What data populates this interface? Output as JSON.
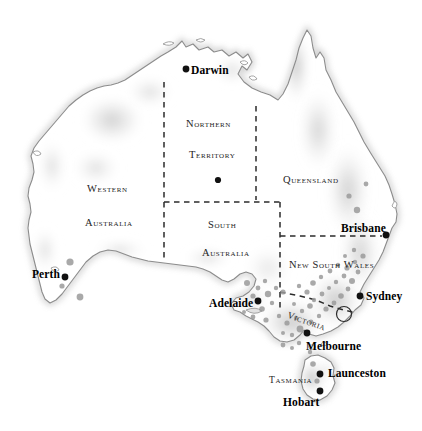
{
  "map": {
    "title": "Australia",
    "background_color": "#ffffff",
    "coast_color": "#8c8c8c",
    "relief_color": "#b5b5b5",
    "border_color": "#2b2b2b",
    "city_dot_color": "#111111",
    "site_dot_color": "#9a9a9a",
    "width": 422,
    "height": 431
  },
  "states": [
    {
      "name": "state-northern-territory",
      "line1": "Northern",
      "line2": "Territory",
      "x": 186,
      "y": 119,
      "x2": 189,
      "y2": 150
    },
    {
      "name": "state-western-australia",
      "line1": "Western",
      "line2": "Australia",
      "x": 87,
      "y": 184,
      "x2": 85,
      "y2": 218
    },
    {
      "name": "state-south-australia",
      "line1": "South",
      "line2": "Australia",
      "x": 208,
      "y": 220,
      "x2": 202,
      "y2": 248
    },
    {
      "name": "state-queensland",
      "line1": "Queensland",
      "x": 283,
      "y": 175
    },
    {
      "name": "state-new-south-wales",
      "line1": "New South Wales",
      "x": 289,
      "y": 260
    },
    {
      "name": "state-victoria",
      "line1": "Victoria",
      "x": 289,
      "y": 311
    },
    {
      "name": "state-tasmania",
      "line1": "Tasmania",
      "x": 269,
      "y": 376
    }
  ],
  "cities": [
    {
      "name": "city-darwin",
      "label": "Darwin",
      "label_x": 191,
      "label_y": 65,
      "dot_x": 186,
      "dot_y": 69,
      "side": "right"
    },
    {
      "name": "city-perth",
      "label": "Perth",
      "label_x": 32,
      "label_y": 269,
      "dot_x": 65,
      "dot_y": 277,
      "side": "left"
    },
    {
      "name": "city-adelaide",
      "label": "Adelaide",
      "label_x": 209,
      "label_y": 298,
      "dot_x": 258,
      "dot_y": 301,
      "side": "left"
    },
    {
      "name": "city-brisbane",
      "label": "Brisbane",
      "label_x": 341,
      "label_y": 223,
      "dot_x": 386,
      "dot_y": 235,
      "side": "left"
    },
    {
      "name": "city-sydney",
      "label": "Sydney",
      "label_x": 366,
      "label_y": 291,
      "dot_x": 360,
      "dot_y": 296,
      "side": "right"
    },
    {
      "name": "city-melbourne",
      "label": "Melbourne",
      "label_x": 306,
      "label_y": 341,
      "dot_x": 307,
      "dot_y": 333,
      "side": "above"
    },
    {
      "name": "city-launceston",
      "label": "Launceston",
      "label_x": 328,
      "label_y": 368,
      "dot_x": 320,
      "dot_y": 374,
      "side": "right"
    },
    {
      "name": "city-hobart",
      "label": "Hobart",
      "label_x": 283,
      "label_y": 397,
      "dot_x": 320,
      "dot_y": 391,
      "side": "left"
    }
  ],
  "unlabeled_capital_dot": {
    "name": "dot-alice-springs",
    "x": 218,
    "y": 180,
    "r": 3.1
  },
  "act_circle": {
    "name": "act-boundary-circle",
    "cx": 344,
    "cy": 314,
    "r": 7.5
  },
  "site_dots": [
    {
      "x": 70,
      "y": 262,
      "r": 3.6
    },
    {
      "x": 62,
      "y": 286,
      "r": 2.6
    },
    {
      "x": 80,
      "y": 297,
      "r": 3.4
    },
    {
      "x": 247,
      "y": 283,
      "r": 3.0
    },
    {
      "x": 258,
      "y": 288,
      "r": 2.4
    },
    {
      "x": 265,
      "y": 281,
      "r": 2.2
    },
    {
      "x": 253,
      "y": 296,
      "r": 2.6
    },
    {
      "x": 268,
      "y": 294,
      "r": 3.2
    },
    {
      "x": 276,
      "y": 288,
      "r": 2.2
    },
    {
      "x": 283,
      "y": 292,
      "r": 2.6
    },
    {
      "x": 272,
      "y": 303,
      "r": 2.2
    },
    {
      "x": 262,
      "y": 309,
      "r": 2.8
    },
    {
      "x": 253,
      "y": 317,
      "r": 2.4
    },
    {
      "x": 244,
      "y": 312,
      "r": 2.0
    },
    {
      "x": 266,
      "y": 320,
      "r": 2.6
    },
    {
      "x": 279,
      "y": 316,
      "r": 2.2
    },
    {
      "x": 287,
      "y": 323,
      "r": 2.6
    },
    {
      "x": 296,
      "y": 318,
      "r": 2.2
    },
    {
      "x": 300,
      "y": 329,
      "r": 3.4
    },
    {
      "x": 292,
      "y": 335,
      "r": 2.2
    },
    {
      "x": 283,
      "y": 333,
      "r": 2.0
    },
    {
      "x": 311,
      "y": 322,
      "r": 2.4
    },
    {
      "x": 319,
      "y": 316,
      "r": 2.2
    },
    {
      "x": 326,
      "y": 309,
      "r": 2.6
    },
    {
      "x": 334,
      "y": 303,
      "r": 2.4
    },
    {
      "x": 341,
      "y": 296,
      "r": 2.8
    },
    {
      "x": 348,
      "y": 289,
      "r": 2.4
    },
    {
      "x": 352,
      "y": 281,
      "r": 3.0
    },
    {
      "x": 344,
      "y": 276,
      "r": 2.4
    },
    {
      "x": 336,
      "y": 282,
      "r": 2.2
    },
    {
      "x": 329,
      "y": 288,
      "r": 2.0
    },
    {
      "x": 322,
      "y": 294,
      "r": 2.4
    },
    {
      "x": 314,
      "y": 300,
      "r": 2.2
    },
    {
      "x": 307,
      "y": 292,
      "r": 2.6
    },
    {
      "x": 299,
      "y": 286,
      "r": 2.2
    },
    {
      "x": 313,
      "y": 283,
      "r": 2.8
    },
    {
      "x": 321,
      "y": 277,
      "r": 2.2
    },
    {
      "x": 330,
      "y": 271,
      "r": 2.4
    },
    {
      "x": 338,
      "y": 265,
      "r": 2.2
    },
    {
      "x": 347,
      "y": 268,
      "r": 2.6
    },
    {
      "x": 355,
      "y": 262,
      "r": 2.2
    },
    {
      "x": 358,
      "y": 272,
      "r": 2.4
    },
    {
      "x": 363,
      "y": 256,
      "r": 2.6
    },
    {
      "x": 354,
      "y": 250,
      "r": 2.2
    },
    {
      "x": 345,
      "y": 256,
      "r": 2.0
    },
    {
      "x": 310,
      "y": 306,
      "r": 2.8
    },
    {
      "x": 302,
      "y": 311,
      "r": 2.2
    },
    {
      "x": 294,
      "y": 304,
      "r": 2.0
    },
    {
      "x": 357,
      "y": 210,
      "r": 3.2
    },
    {
      "x": 349,
      "y": 196,
      "r": 2.6
    },
    {
      "x": 366,
      "y": 184,
      "r": 2.4
    },
    {
      "x": 313,
      "y": 364,
      "r": 2.8
    },
    {
      "x": 317,
      "y": 381,
      "r": 2.6
    },
    {
      "x": 310,
      "y": 352,
      "r": 2.2
    },
    {
      "x": 283,
      "y": 345,
      "r": 2.4
    },
    {
      "x": 292,
      "y": 348,
      "r": 2.0
    },
    {
      "x": 299,
      "y": 343,
      "r": 2.2
    }
  ]
}
